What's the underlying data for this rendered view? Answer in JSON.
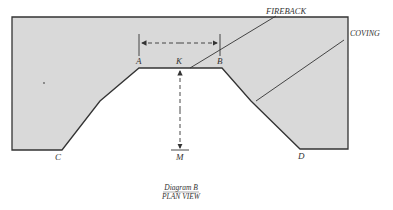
{
  "diagram": {
    "labels": {
      "A": "A",
      "K": "K",
      "B": "B",
      "C": "C",
      "D": "D",
      "M": "M",
      "fireback": "FIREBACK",
      "coving": "COVING"
    },
    "caption": {
      "line1": "Diagram B",
      "line2": "PLAN VIEW"
    },
    "colors": {
      "fill": "#d9d9d9",
      "stroke": "#333333"
    }
  }
}
